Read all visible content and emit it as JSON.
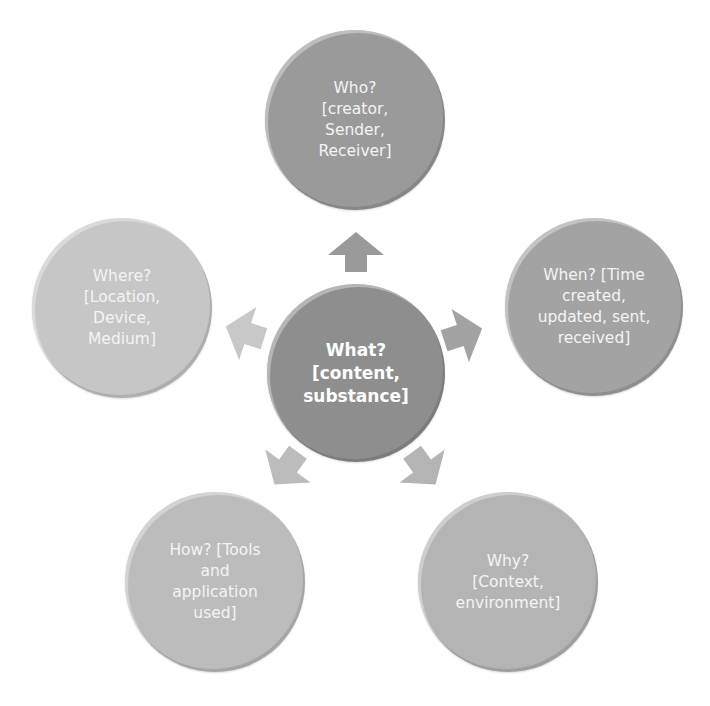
{
  "diagram": {
    "type": "radial-cycle",
    "center": {
      "label": "What?\n[content,\nsubstance]",
      "color": "#8e8e8e"
    },
    "nodes": [
      {
        "id": "who",
        "label": "Who?\n[creator,\nSender,\nReceiver]",
        "color": "#9a9a9a"
      },
      {
        "id": "when",
        "label": "When? [Time\ncreated,\nupdated, sent,\nreceived]",
        "color": "#a3a3a3"
      },
      {
        "id": "why",
        "label": "Why?\n[Context,\nenvironment]",
        "color": "#b4b4b4"
      },
      {
        "id": "how",
        "label": "How? [Tools\nand\napplication\nused]",
        "color": "#bcbcbc"
      },
      {
        "id": "where",
        "label": "Where?\n[Location,\nDevice,\nMedium]",
        "color": "#c6c6c6"
      }
    ],
    "arrow_colors": {
      "who": "#9a9a9a",
      "when": "#a3a3a3",
      "why": "#b4b4b4",
      "how": "#bcbcbc",
      "where": "#c8c8c8"
    }
  }
}
